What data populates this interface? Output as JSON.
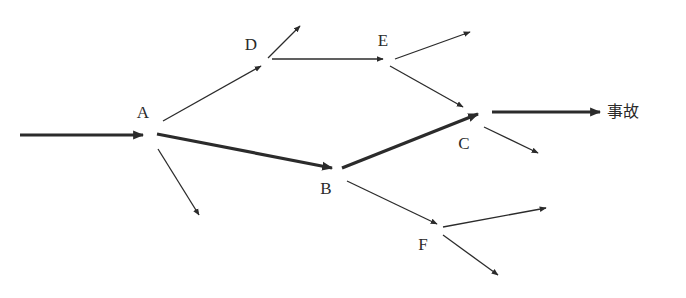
{
  "diagram": {
    "type": "event-chain",
    "nodes": [
      {
        "id": "A",
        "label": "A",
        "x": 143,
        "y": 112
      },
      {
        "id": "B",
        "label": "B",
        "x": 326,
        "y": 188
      },
      {
        "id": "C",
        "label": "C",
        "x": 464,
        "y": 143
      },
      {
        "id": "D",
        "label": "D",
        "x": 251,
        "y": 44
      },
      {
        "id": "E",
        "label": "E",
        "x": 383,
        "y": 40
      },
      {
        "id": "F",
        "label": "F",
        "x": 423,
        "y": 244
      }
    ],
    "outcome": {
      "id": "accident",
      "label": "事故",
      "x": 607,
      "y": 112
    },
    "edges": [
      {
        "id": "input-to-A",
        "from": "input",
        "to": "A",
        "x1": 20,
        "y1": 135,
        "x2": 143,
        "y2": 135,
        "weight": "thick"
      },
      {
        "id": "A-to-D",
        "from": "A",
        "to": "D",
        "x1": 163,
        "y1": 121,
        "x2": 261,
        "y2": 66,
        "weight": "thin"
      },
      {
        "id": "A-to-B",
        "from": "A",
        "to": "B",
        "x1": 157,
        "y1": 134,
        "x2": 332,
        "y2": 168,
        "weight": "thick"
      },
      {
        "id": "A-branch",
        "from": "A",
        "to": "open",
        "x1": 158,
        "y1": 149,
        "x2": 199,
        "y2": 215,
        "weight": "thin"
      },
      {
        "id": "D-branch",
        "from": "D",
        "to": "open",
        "x1": 268,
        "y1": 58,
        "x2": 300,
        "y2": 26,
        "weight": "thin"
      },
      {
        "id": "D-to-E",
        "from": "D",
        "to": "E",
        "x1": 272,
        "y1": 59,
        "x2": 383,
        "y2": 59,
        "weight": "thin"
      },
      {
        "id": "E-branch",
        "from": "E",
        "to": "open",
        "x1": 395,
        "y1": 59,
        "x2": 470,
        "y2": 32,
        "weight": "thin"
      },
      {
        "id": "E-to-C",
        "from": "E",
        "to": "C",
        "x1": 390,
        "y1": 66,
        "x2": 463,
        "y2": 107,
        "weight": "thin"
      },
      {
        "id": "B-to-C",
        "from": "B",
        "to": "C",
        "x1": 342,
        "y1": 168,
        "x2": 478,
        "y2": 114,
        "weight": "thick"
      },
      {
        "id": "C-to-accident",
        "from": "C",
        "to": "accident",
        "x1": 492,
        "y1": 112,
        "x2": 600,
        "y2": 112,
        "weight": "thick"
      },
      {
        "id": "C-branch",
        "from": "C",
        "to": "open",
        "x1": 484,
        "y1": 127,
        "x2": 538,
        "y2": 153,
        "weight": "thin"
      },
      {
        "id": "B-to-F",
        "from": "B",
        "to": "F",
        "x1": 347,
        "y1": 181,
        "x2": 437,
        "y2": 224,
        "weight": "thin"
      },
      {
        "id": "F-branch-right",
        "from": "F",
        "to": "open",
        "x1": 443,
        "y1": 227,
        "x2": 546,
        "y2": 208,
        "weight": "thin"
      },
      {
        "id": "F-branch-down",
        "from": "F",
        "to": "open",
        "x1": 443,
        "y1": 235,
        "x2": 498,
        "y2": 275,
        "weight": "thin"
      }
    ],
    "colors": {
      "line": "#2b2b2b",
      "background": "#ffffff",
      "text": "#2a2a2a"
    }
  }
}
